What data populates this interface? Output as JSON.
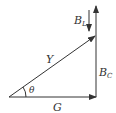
{
  "diagram": {
    "type": "vector-triangle",
    "colors": {
      "stroke": "#333333",
      "background": "#ffffff"
    },
    "labels": {
      "Y": "Y",
      "G": "G",
      "theta": "θ",
      "BL_main": "B",
      "BL_sub": "L",
      "BC_main": "B",
      "BC_sub": "C"
    },
    "vectors": [
      {
        "name": "G",
        "from": [
          9,
          97
        ],
        "to": [
          96,
          97
        ]
      },
      {
        "name": "Y",
        "from": [
          9,
          97
        ],
        "to": [
          95,
          36
        ]
      },
      {
        "name": "B_C",
        "from": [
          96,
          97
        ],
        "to": [
          96,
          6
        ]
      },
      {
        "name": "B_L",
        "from": [
          89,
          10
        ],
        "to": [
          89,
          31
        ]
      }
    ]
  }
}
